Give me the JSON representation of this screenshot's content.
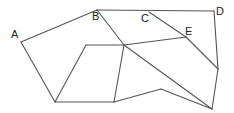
{
  "diagram": {
    "type": "geometric-figure",
    "stroke_color": "#555555",
    "label_color": "#222222",
    "labels": [
      {
        "id": "A",
        "text": "A",
        "x": 11,
        "y": 38
      },
      {
        "id": "B",
        "text": "B",
        "x": 92,
        "y": 20
      },
      {
        "id": "C",
        "text": "C",
        "x": 141,
        "y": 22
      },
      {
        "id": "D",
        "text": "D",
        "x": 216,
        "y": 15
      },
      {
        "id": "E",
        "text": "E",
        "x": 185,
        "y": 35
      }
    ],
    "points": {
      "A": [
        21,
        42
      ],
      "B": [
        97,
        10
      ],
      "C": [
        149,
        12
      ],
      "D": [
        214,
        11
      ],
      "E": [
        186,
        37
      ],
      "O": [
        124,
        45
      ],
      "P": [
        86,
        45
      ],
      "Q": [
        55,
        102
      ],
      "R": [
        114,
        102
      ],
      "S": [
        161,
        89
      ],
      "T": [
        212,
        109
      ],
      "U": [
        218,
        69
      ]
    },
    "edges": [
      [
        "A",
        "B"
      ],
      [
        "B",
        "D"
      ],
      [
        "D",
        "U"
      ],
      [
        "U",
        "T"
      ],
      [
        "A",
        "Q"
      ],
      [
        "Q",
        "R"
      ],
      [
        "R",
        "S"
      ],
      [
        "S",
        "T"
      ],
      [
        "B",
        "O"
      ],
      [
        "O",
        "T"
      ],
      [
        "C",
        "E"
      ],
      [
        "E",
        "U"
      ],
      [
        "P",
        "O"
      ],
      [
        "O",
        "E"
      ],
      [
        "P",
        "Q"
      ],
      [
        "O",
        "R"
      ]
    ]
  }
}
